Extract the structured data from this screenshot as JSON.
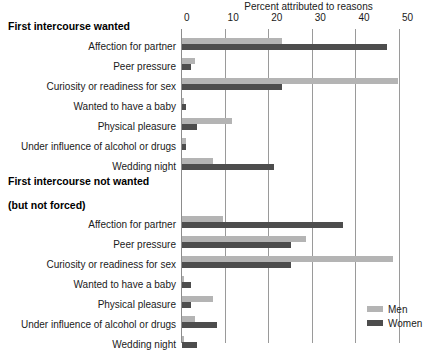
{
  "chart_data": {
    "type": "bar",
    "orientation": "horizontal",
    "title": "",
    "xlabel": "Percent attributed to reasons",
    "ylabel": "",
    "xlim": [
      0,
      50
    ],
    "xticks": [
      0,
      10,
      20,
      30,
      40,
      50
    ],
    "xtick_labels": [
      "0",
      "10",
      "20",
      "30",
      "40",
      "50"
    ],
    "grid": true,
    "legend_position": "bottom-right",
    "legend": [
      "Men",
      "Women"
    ],
    "series_colors": {
      "Men": "#b4b4b4",
      "Women": "#4d4d4d"
    },
    "panels": [
      {
        "heading": "First intercourse wanted",
        "categories": [
          "Affection for partner",
          "Peer pressure",
          "Curiosity or readiness for sex",
          "Wanted to have a baby",
          "Physical pleasure",
          "Under influence of alcohol or drugs",
          "Wedding night"
        ],
        "series": [
          {
            "name": "Men",
            "values": [
              23,
              3,
              49.5,
              0.5,
              11.5,
              1,
              7
            ]
          },
          {
            "name": "Women",
            "values": [
              47,
              2,
              23,
              1,
              3.5,
              1,
              21
            ]
          }
        ]
      },
      {
        "heading": "First intercourse not wanted\n(but not forced)",
        "categories": [
          "Affection for partner",
          "Peer pressure",
          "Curiosity or readiness for sex",
          "Wanted to have a baby",
          "Physical pleasure",
          "Under influence of alcohol or drugs",
          "Wedding night"
        ],
        "series": [
          {
            "name": "Men",
            "values": [
              9.5,
              28.5,
              48.5,
              0.5,
              7,
              3,
              0.5
            ]
          },
          {
            "name": "Women",
            "values": [
              37,
              25,
              25,
              2,
              2,
              8,
              3.5
            ]
          }
        ]
      }
    ]
  },
  "axis": {
    "title": "Percent attributed to reasons"
  },
  "legend": {
    "men_label": "Men",
    "women_label": "Women"
  },
  "panel1": {
    "heading": "First intercourse wanted",
    "cat0": "Affection for partner",
    "cat1": "Peer pressure",
    "cat2": "Curiosity or readiness for sex",
    "cat3": "Wanted to have a baby",
    "cat4": "Physical pleasure",
    "cat5": "Under influence of alcohol or drugs",
    "cat6": "Wedding night"
  },
  "panel2": {
    "heading": "First intercourse not wanted (but not forced)",
    "heading_line1": "First intercourse not wanted",
    "heading_line2": "(but not forced)",
    "cat0": "Affection for partner",
    "cat1": "Peer pressure",
    "cat2": "Curiosity or readiness for sex",
    "cat3": "Wanted to have a baby",
    "cat4": "Physical pleasure",
    "cat5": "Under influence of alcohol or drugs",
    "cat6": "Wedding night"
  },
  "ticks": {
    "t0": "0",
    "t1": "10",
    "t2": "20",
    "t3": "30",
    "t4": "40",
    "t5": "50"
  }
}
